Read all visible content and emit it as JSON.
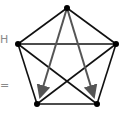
{
  "diagram": {
    "type": "complete-graph-K5",
    "nodes": [
      {
        "id": "top",
        "x": 67,
        "y": 8
      },
      {
        "id": "left",
        "x": 18,
        "y": 44
      },
      {
        "id": "right",
        "x": 116,
        "y": 44
      },
      {
        "id": "bottom-left",
        "x": 37,
        "y": 104
      },
      {
        "id": "bottom-right",
        "x": 97,
        "y": 104
      }
    ],
    "edges": [
      [
        "top",
        "left"
      ],
      [
        "top",
        "right"
      ],
      [
        "left",
        "right"
      ],
      [
        "left",
        "bottom-left"
      ],
      [
        "right",
        "bottom-right"
      ],
      [
        "bottom-left",
        "bottom-right"
      ],
      [
        "left",
        "bottom-right"
      ],
      [
        "right",
        "bottom-left"
      ]
    ],
    "arrows": [
      {
        "from": "top",
        "to": "bottom-left"
      },
      {
        "from": "top",
        "to": "bottom-right"
      }
    ],
    "colors": {
      "edge": "#111111",
      "arrow": "#555555",
      "node": "#000000"
    }
  },
  "left_fragments": {
    "upper": "H",
    "lower": "="
  }
}
